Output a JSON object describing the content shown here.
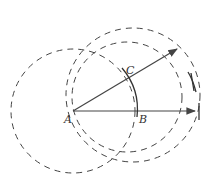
{
  "diagram": {
    "type": "geometric-construction",
    "points": {
      "A": {
        "label": "A",
        "x": 73,
        "y": 111
      },
      "B": {
        "label": "B",
        "x": 137,
        "y": 111
      },
      "C": {
        "label": "C",
        "x": 128,
        "y": 79
      }
    },
    "rays": [
      {
        "name": "ray-AB",
        "from": "A",
        "to": [
          196,
          111
        ]
      },
      {
        "name": "ray-AC",
        "from": "A",
        "to": [
          178,
          48
        ]
      }
    ],
    "arcs": [
      {
        "name": "arc-BC",
        "center": "A",
        "radius": 64,
        "style": "solid"
      }
    ],
    "circles": [
      {
        "name": "circle-centered-A",
        "cx": 73,
        "cy": 111,
        "r": 62,
        "style": "dashed"
      },
      {
        "name": "circle-large",
        "cx": 133,
        "cy": 95,
        "r": 67,
        "style": "dashed"
      },
      {
        "name": "circle-middle",
        "cx": 127,
        "cy": 97,
        "r": 55,
        "style": "dashed"
      }
    ],
    "colors": {
      "stroke": "#444444",
      "background": "#ffffff"
    }
  }
}
